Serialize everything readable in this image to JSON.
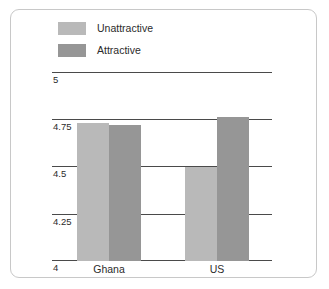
{
  "chart_data": {
    "type": "bar",
    "title": "",
    "subtitle": "",
    "xlabel": "",
    "ylabel": "",
    "categories": [
      "Ghana",
      "US"
    ],
    "series": [
      {
        "name": "Unattractive",
        "color": "#b9b9b9",
        "values": [
          4.73,
          4.5
        ]
      },
      {
        "name": "Attractive",
        "color": "#969696",
        "values": [
          4.72,
          4.76
        ]
      }
    ],
    "ylim": [
      4,
      5
    ],
    "yticks": [
      "4",
      "4.25",
      "4.5",
      "4.75",
      "5"
    ],
    "ytick_values": [
      4,
      4.25,
      4.5,
      4.75,
      5
    ],
    "grid": true,
    "legend_position": "top-left",
    "annotations": []
  },
  "legend": {
    "items": [
      {
        "label": "Unattractive",
        "color": "#b9b9b9"
      },
      {
        "label": "Attractive",
        "color": "#969696"
      }
    ]
  },
  "axis": {
    "y_labels": {
      "t5": "5",
      "t475": "4.75",
      "t45": "4.5",
      "t425": "4.25",
      "t4": "4"
    },
    "x_labels": {
      "c0": "Ghana",
      "c1": "US"
    }
  },
  "colors": {
    "unattractive": "#b9b9b9",
    "attractive": "#969696",
    "gridline": "#4a4a4a",
    "frame": "#c8c8c8",
    "text": "#2b2b2b",
    "background": "#ffffff"
  }
}
